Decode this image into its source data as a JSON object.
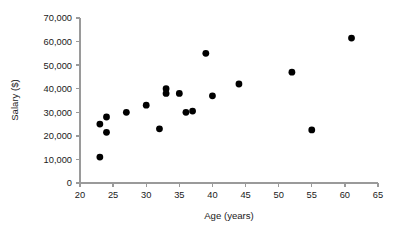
{
  "chart_data": {
    "type": "scatter",
    "title": "",
    "xlabel": "Age (years)",
    "ylabel": "Salary ($)",
    "xlim": [
      20,
      65
    ],
    "ylim": [
      0,
      70000
    ],
    "grid": false,
    "legend": null,
    "xticks": [
      20,
      25,
      30,
      35,
      40,
      45,
      50,
      55,
      60,
      65
    ],
    "xtick_labels": [
      "20",
      "25",
      "30",
      "35",
      "40",
      "45",
      "50",
      "55",
      "60",
      "65"
    ],
    "yticks": [
      0,
      10000,
      20000,
      30000,
      40000,
      50000,
      60000,
      70000
    ],
    "ytick_labels": [
      "0",
      "10,000",
      "20,000",
      "30,000",
      "40,000",
      "50,000",
      "60,000",
      "70,000"
    ],
    "marker": "filled-circle",
    "marker_color": "#000000",
    "marker_size": 3.4,
    "axis_color": "#9a9a9a",
    "points": [
      {
        "x": 23,
        "y": 11000
      },
      {
        "x": 23,
        "y": 25000
      },
      {
        "x": 24,
        "y": 28000
      },
      {
        "x": 24,
        "y": 21500
      },
      {
        "x": 27,
        "y": 30000
      },
      {
        "x": 30,
        "y": 33000
      },
      {
        "x": 32,
        "y": 23000
      },
      {
        "x": 33,
        "y": 40000
      },
      {
        "x": 33,
        "y": 38000
      },
      {
        "x": 35,
        "y": 38000
      },
      {
        "x": 36,
        "y": 30000
      },
      {
        "x": 37,
        "y": 30500
      },
      {
        "x": 39,
        "y": 55000
      },
      {
        "x": 40,
        "y": 37000
      },
      {
        "x": 44,
        "y": 42000
      },
      {
        "x": 52,
        "y": 47000
      },
      {
        "x": 55,
        "y": 22500
      },
      {
        "x": 61,
        "y": 61500
      }
    ]
  }
}
